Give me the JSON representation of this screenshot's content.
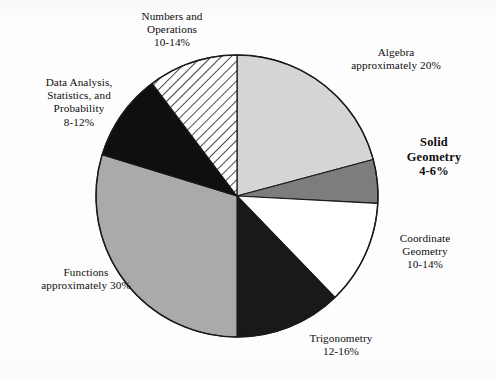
{
  "chart_data": {
    "type": "pie",
    "title": "",
    "subtitle": "",
    "xlabel": "",
    "ylabel": "",
    "legend_position": "callout-labels",
    "grid": false,
    "center": {
      "x": 237,
      "y": 196
    },
    "radius": 141,
    "start_angle_deg": 0,
    "direction": "clockwise",
    "total_percent": 100,
    "categories": [
      "Algebra",
      "Solid Geometry",
      "Coordinate Geometry",
      "Trigonometry",
      "Functions",
      "Data Analysis, Statistics, and Probability",
      "Numbers and Operations"
    ],
    "values": [
      20,
      5,
      12,
      14,
      30,
      10,
      12
    ],
    "slices": [
      {
        "name": "Algebra",
        "label_line1": "Algebra",
        "label_line2": "approximately 20%",
        "label_line3": "",
        "label_line4": "",
        "value": 20,
        "range_text": "approximately 20%",
        "start_deg": 0,
        "end_deg": 75,
        "fill": "#d5d5d5",
        "pattern": "solid",
        "bold_label": false
      },
      {
        "name": "Solid Geometry",
        "label_line1": "Solid",
        "label_line2": "Geometry",
        "label_line3": "4-6%",
        "label_line4": "",
        "value": 5,
        "range_text": "4-6%",
        "start_deg": 75,
        "end_deg": 93,
        "fill": "#7d7d7d",
        "pattern": "solid",
        "bold_label": true
      },
      {
        "name": "Coordinate Geometry",
        "label_line1": "Coordinate",
        "label_line2": "Geometry",
        "label_line3": "10-14%",
        "label_line4": "",
        "value": 12,
        "range_text": "10-14%",
        "start_deg": 93,
        "end_deg": 136,
        "fill": "#ffffff",
        "pattern": "solid",
        "bold_label": false
      },
      {
        "name": "Trigonometry",
        "label_line1": "Trigonometry",
        "label_line2": "12-16%",
        "label_line3": "",
        "label_line4": "",
        "value": 14,
        "range_text": "12-16%",
        "start_deg": 136,
        "end_deg": 180,
        "fill": "#191919",
        "pattern": "solid",
        "bold_label": false
      },
      {
        "name": "Functions",
        "label_line1": "Functions",
        "label_line2": "approximately 30%",
        "label_line3": "",
        "label_line4": "",
        "value": 30,
        "range_text": "approximately 30%",
        "start_deg": 180,
        "end_deg": 287,
        "fill": "#aaaaaa",
        "pattern": "solid",
        "bold_label": false
      },
      {
        "name": "Data Analysis, Statistics, and Probability",
        "label_line1": "Data Analysis,",
        "label_line2": "Statistics, and",
        "label_line3": "Probability",
        "label_line4": "8-12%",
        "value": 10,
        "range_text": "8-12%",
        "start_deg": 287,
        "end_deg": 323,
        "fill": "#0f0f0f",
        "pattern": "solid",
        "bold_label": false
      },
      {
        "name": "Numbers and Operations",
        "label_line1": "Numbers and",
        "label_line2": "Operations",
        "label_line3": "10-14%",
        "label_line4": "",
        "value": 12,
        "range_text": "10-14%",
        "start_deg": 323,
        "end_deg": 360,
        "fill": "#ffffff",
        "pattern": "diagonal-hatch",
        "bold_label": false
      }
    ],
    "colors": {
      "algebra": "#d5d5d5",
      "solid_geometry": "#7d7d7d",
      "coordinate_geometry": "#ffffff",
      "trigonometry": "#191919",
      "functions": "#aaaaaa",
      "data_analysis": "#0f0f0f",
      "numbers_operations": "#ffffff",
      "outline": "#1a1a1a",
      "background": "#fdfdfd"
    }
  }
}
